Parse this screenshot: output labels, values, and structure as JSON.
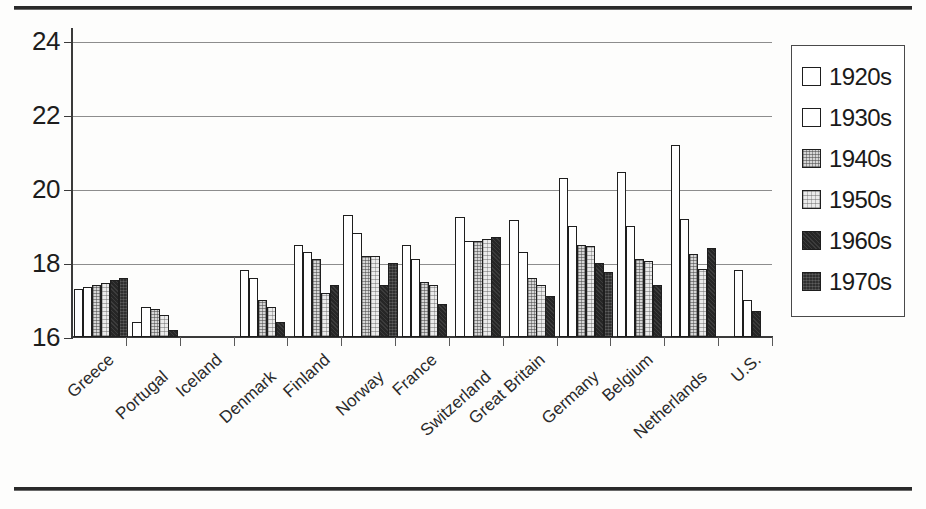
{
  "chart_data": {
    "type": "bar",
    "title": "",
    "xlabel": "",
    "ylabel": "",
    "ylim": [
      16,
      24
    ],
    "yticks": [
      16,
      18,
      20,
      22,
      24
    ],
    "grid": true,
    "legend_position": "right",
    "categories": [
      "Greece",
      "Portugal",
      "Iceland",
      "Denmark",
      "Finland",
      "Norway",
      "France",
      "Switzerland",
      "Great Britain",
      "Germany",
      "Belgium",
      "Netherlands",
      "U.S."
    ],
    "series": [
      {
        "name": "1920s",
        "color": "#ffffff",
        "values": [
          17.3,
          16.4,
          null,
          17.8,
          18.5,
          19.3,
          18.5,
          19.25,
          19.15,
          20.3,
          20.45,
          21.2,
          17.8
        ]
      },
      {
        "name": "1930s",
        "color": "#ffffff",
        "values": [
          17.35,
          16.8,
          null,
          17.6,
          18.3,
          18.8,
          18.1,
          18.6,
          18.3,
          19.0,
          19.0,
          19.2,
          17.0
        ]
      },
      {
        "name": "1940s",
        "color": "#d6d6d6",
        "values": [
          17.4,
          16.75,
          null,
          17.0,
          18.1,
          18.2,
          17.5,
          18.6,
          17.6,
          18.5,
          18.1,
          18.25,
          null
        ]
      },
      {
        "name": "1950s",
        "color": "#eaeaea",
        "values": [
          17.45,
          16.6,
          null,
          16.8,
          17.2,
          18.2,
          17.4,
          18.65,
          17.4,
          18.45,
          18.05,
          17.85,
          null
        ]
      },
      {
        "name": "1960s",
        "color": "#262626",
        "values": [
          17.55,
          16.2,
          null,
          16.4,
          17.4,
          17.4,
          16.9,
          18.7,
          17.1,
          18.0,
          17.4,
          18.4,
          16.7
        ]
      },
      {
        "name": "1970s",
        "color": "#2f2f2f",
        "values": [
          17.6,
          null,
          null,
          null,
          null,
          18.0,
          null,
          null,
          null,
          17.75,
          null,
          null,
          null
        ]
      }
    ]
  },
  "legend": {
    "items": [
      {
        "label": "1920s",
        "swatch": "sw-1920s"
      },
      {
        "label": "1930s",
        "swatch": "sw-1930s"
      },
      {
        "label": "1940s",
        "swatch": "sw-1940s"
      },
      {
        "label": "1950s",
        "swatch": "sw-1950s"
      },
      {
        "label": "1960s",
        "swatch": "sw-1960s"
      },
      {
        "label": "1970s",
        "swatch": "sw-1970s"
      }
    ]
  }
}
